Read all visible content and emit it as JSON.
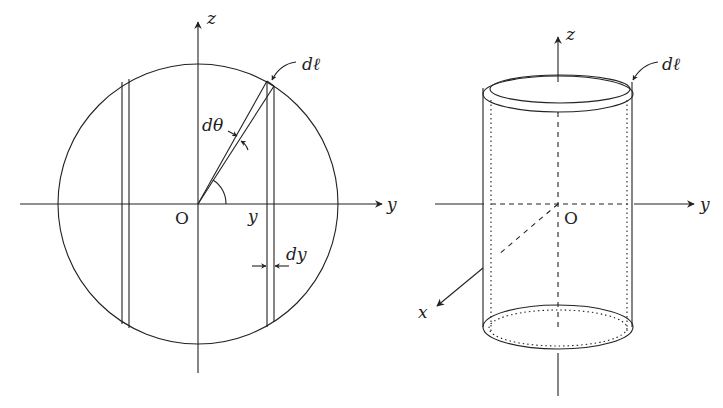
{
  "left_figure": {
    "description": "Circle cross-section with strip of width dy and angular element",
    "labels": {
      "z_axis": "z",
      "y_axis": "y",
      "origin": "O",
      "y_position": "y",
      "dy": "dy",
      "dtheta": "dθ",
      "dl": "dℓ"
    }
  },
  "right_figure": {
    "description": "Thin cylindrical shell with axes x, y, z",
    "labels": {
      "z_axis": "z",
      "y_axis": "y",
      "x_axis": "x",
      "origin": "O",
      "dl": "dℓ"
    }
  },
  "colors": {
    "stroke": "#222222",
    "background": "#ffffff"
  }
}
